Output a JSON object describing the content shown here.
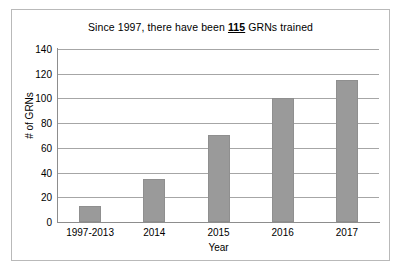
{
  "chart_data": {
    "type": "bar",
    "title_prefix": "Since 1997, there have been ",
    "title_emphasis": "115",
    "title_suffix": " GRNs trained",
    "title": "Since 1997, there have been 115 GRNs trained",
    "categories": [
      "1997-2013",
      "2014",
      "2015",
      "2016",
      "2017"
    ],
    "values": [
      13,
      35,
      70,
      100,
      115
    ],
    "series": [
      {
        "name": "# of GRNs",
        "values": [
          13,
          35,
          70,
          100,
          115
        ]
      }
    ],
    "xlabel": "Year",
    "ylabel": "# of GRNs",
    "ylim": [
      0,
      140
    ],
    "ytick_labels": [
      "140",
      "120",
      "100",
      "80",
      "60",
      "40",
      "20",
      "0"
    ],
    "ytick_values": [
      140,
      120,
      100,
      80,
      60,
      40,
      20,
      0
    ],
    "grid": true,
    "legend": false,
    "bar_color": "#9a9a9a",
    "grid_color": "#a6a6a6",
    "axis_color": "#8d8d8d",
    "border_color": "#b9b9b9",
    "background_color": "#ffffff"
  }
}
